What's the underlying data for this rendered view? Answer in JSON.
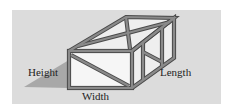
{
  "diagram": {
    "labels": {
      "height": "Height",
      "width": "Width",
      "length": "Length"
    },
    "colors": {
      "background": "#ffffff",
      "panel": "#dcdcdc",
      "frame": "#8a8a8a",
      "frame_edge": "#4a4a4a",
      "face_fill": "#f4f4f4",
      "shadow": "#a8a8a8",
      "text": "#222222"
    }
  }
}
